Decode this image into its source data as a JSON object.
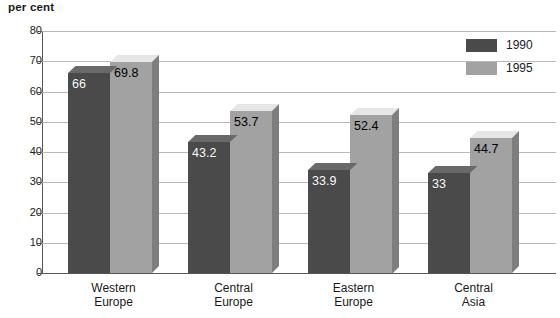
{
  "chart_data": {
    "type": "bar",
    "title": "",
    "ylabel": "per cent",
    "xlabel": "",
    "ylim": [
      0,
      80
    ],
    "yticks": [
      0,
      10,
      20,
      30,
      40,
      50,
      60,
      70,
      80
    ],
    "ytick_labels": [
      "0",
      "10",
      "20",
      "30",
      "40",
      "50",
      "60",
      "70",
      "80"
    ],
    "grid": true,
    "legend_position": "top-right",
    "categories": [
      "Western Europe",
      "Central Europe",
      "Eastern Europe",
      "Central Asia"
    ],
    "category_lines": [
      [
        "Western",
        "Europe"
      ],
      [
        "Central",
        "Europe"
      ],
      [
        "Eastern",
        "Europe"
      ],
      [
        "Central",
        "Asia"
      ]
    ],
    "series": [
      {
        "name": "1990",
        "color": "#4a4a4a",
        "values": [
          66,
          43.2,
          33.9,
          33
        ],
        "labels": [
          "66",
          "43.2",
          "33.9",
          "33"
        ]
      },
      {
        "name": "1995",
        "color": "#a2a2a2",
        "values": [
          69.8,
          53.7,
          52.4,
          44.7
        ],
        "labels": [
          "69.8",
          "53.7",
          "52.4",
          "44.7"
        ]
      }
    ]
  },
  "axis": {
    "y_title": "per cent"
  },
  "legend": {
    "items": [
      {
        "label": "1990",
        "color": "#4a4a4a"
      },
      {
        "label": "1995",
        "color": "#a2a2a2"
      }
    ]
  },
  "colors": {
    "series_1990": "#4a4a4a",
    "series_1995": "#a2a2a2",
    "gridline": "#b8b8b8",
    "axis": "#555555",
    "background": "#ffffff"
  }
}
